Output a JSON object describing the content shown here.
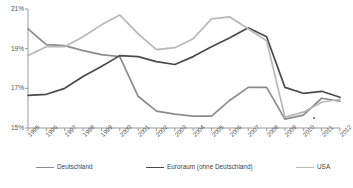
{
  "chart_data": {
    "type": "line",
    "title": "",
    "xlabel": "",
    "ylabel": "",
    "ylim": [
      15,
      21
    ],
    "yticks": [
      "15%",
      "17%",
      "19%",
      "21%"
    ],
    "ytick_values": [
      15,
      17,
      19,
      21
    ],
    "grid": false,
    "legend_position": "bottom",
    "categories": [
      "1995",
      "1996",
      "1997",
      "1998",
      "1999",
      "2000",
      "2001",
      "2002",
      "2003",
      "2004",
      "2005",
      "2006",
      "2007",
      "2008",
      "2009",
      "2010",
      "2011",
      "2012"
    ],
    "series": [
      {
        "name": "Deutschland",
        "color": "#8c8c8c",
        "values": [
          20.0,
          19.2,
          19.15,
          18.9,
          18.7,
          18.6,
          16.6,
          15.85,
          15.7,
          15.6,
          15.6,
          16.4,
          17.05,
          17.05,
          15.45,
          15.65,
          16.5,
          16.35
        ]
      },
      {
        "name": "Euroraum (ohne Deutschland)",
        "color": "#4a4a4a",
        "values": [
          16.65,
          16.7,
          17.0,
          17.6,
          18.1,
          18.65,
          18.6,
          18.35,
          18.2,
          18.6,
          19.1,
          19.55,
          20.05,
          19.6,
          17.05,
          16.75,
          16.85,
          16.55
        ]
      },
      {
        "name": "USA",
        "color": "#b8b8b8",
        "values": [
          18.65,
          19.1,
          19.1,
          19.6,
          20.2,
          20.7,
          19.75,
          18.95,
          19.05,
          19.5,
          20.5,
          20.6,
          20.0,
          19.4,
          15.55,
          15.8,
          16.3,
          16.45
        ]
      }
    ]
  },
  "axis": {
    "line_color": "#9a9a9a"
  },
  "legend": {
    "items": [
      {
        "label": "Deutschland"
      },
      {
        "label": "Euroraum (ohne Deutschland)"
      },
      {
        "label": "USA"
      }
    ]
  }
}
